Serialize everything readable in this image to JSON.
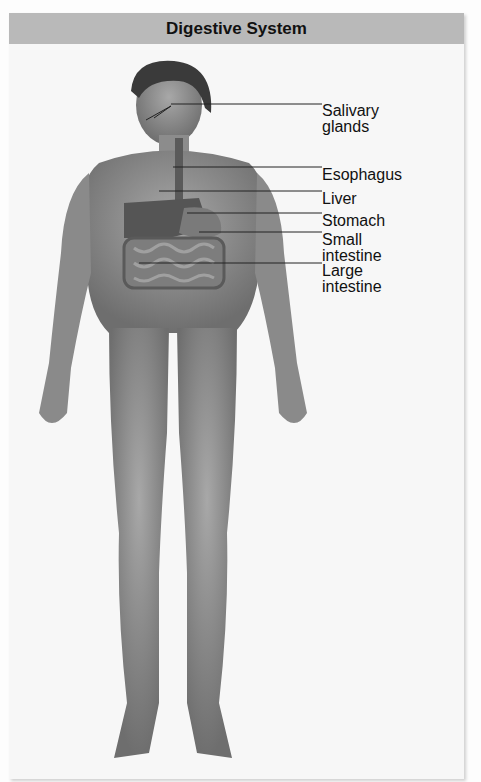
{
  "title": "Digestive System",
  "labels": {
    "salivary_1": "Salivary",
    "salivary_2": "glands",
    "esophagus": "Esophagus",
    "liver": "Liver",
    "stomach": "Stomach",
    "small_1": "Small",
    "small_2": "intestine",
    "large_1": "Large",
    "large_2": "intestine"
  },
  "colors": {
    "header_bg": "#b9b9b9",
    "body": "#8a8a8a",
    "organs": "#6a6a6a"
  }
}
